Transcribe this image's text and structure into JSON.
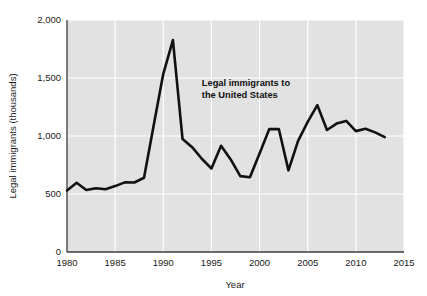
{
  "chart_data": {
    "type": "line",
    "title": "",
    "subtitle": "",
    "xlabel": "Year",
    "ylabel": "Legal immigrants (thousands)",
    "xlim": [
      1980,
      2015
    ],
    "ylim": [
      0,
      2000
    ],
    "grid": true,
    "legend_position": "none",
    "annotations": [
      {
        "name": "series-callout",
        "line1": "Legal immigrants to",
        "line2": "the United States",
        "x": 1994.0,
        "y": 1430
      }
    ],
    "xticks": [
      1980,
      1985,
      1990,
      1995,
      2000,
      2005,
      2010,
      2015
    ],
    "xtick_labels": [
      "1980",
      "1985",
      "1990",
      "1995",
      "2000",
      "2005",
      "2010",
      "2015"
    ],
    "yticks": [
      0,
      500,
      1000,
      1500,
      2000
    ],
    "ytick_labels": [
      "0",
      "500",
      "1,000",
      "1,500",
      "2,000"
    ],
    "series": [
      {
        "name": "Legal immigrants to the United States",
        "units": "thousands",
        "color": "#111111",
        "x": [
          1980,
          1981,
          1982,
          1983,
          1984,
          1985,
          1986,
          1987,
          1988,
          1989,
          1990,
          1991,
          1992,
          1993,
          1994,
          1995,
          1996,
          1997,
          1998,
          1999,
          2000,
          2001,
          2002,
          2003,
          2004,
          2005,
          2006,
          2007,
          2008,
          2009,
          2010,
          2011,
          2012,
          2013
        ],
        "values": [
          531,
          597,
          534,
          550,
          541,
          568,
          600,
          599,
          640,
          1090,
          1536,
          1827,
          974,
          904,
          804,
          720,
          916,
          798,
          654,
          645,
          850,
          1059,
          1060,
          704,
          958,
          1122,
          1266,
          1052,
          1107,
          1130,
          1042,
          1062,
          1031,
          990
        ]
      }
    ]
  },
  "colors": {
    "plot_background": "#e2e2e2",
    "gridline": "#ffffff",
    "axis": "#3c3c3c",
    "line": "#111111",
    "text": "#1a1a1a",
    "page_background": "#ffffff"
  }
}
